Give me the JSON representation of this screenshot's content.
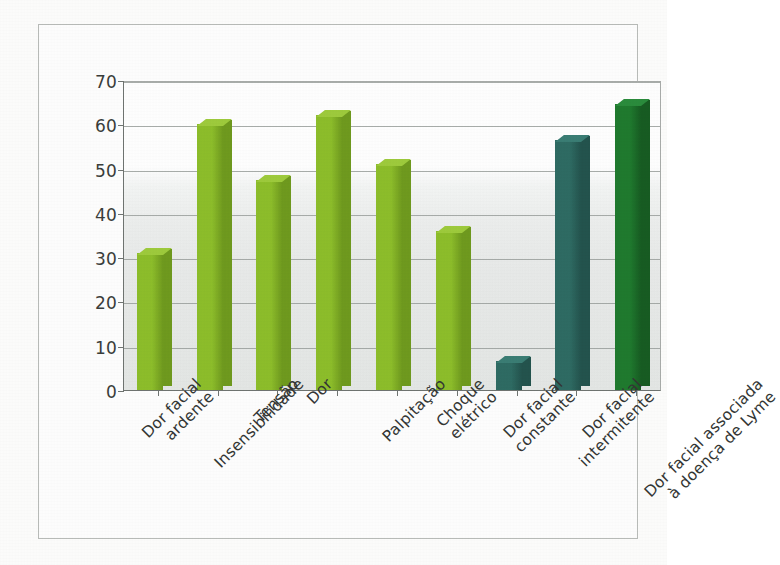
{
  "chart_data": {
    "type": "bar",
    "title": "",
    "xlabel": "",
    "ylabel": "",
    "ylim": [
      0,
      70
    ],
    "ytick_step": 10,
    "ytick_labels": [
      "0",
      "10",
      "20",
      "30",
      "40",
      "50",
      "60",
      "70"
    ],
    "grid": true,
    "legend": "none",
    "categories": [
      "Dor facial\nardente",
      "Insensibilidade",
      "Tensão",
      "Dor",
      "Palpitação",
      "Choque\nelétrico",
      "Dor facial\nconstante",
      "Dor facial\nintermitente",
      "Dor facial associada\nà doença de Lyme"
    ],
    "values": [
      31,
      60,
      47.5,
      62,
      51,
      36,
      6.5,
      56.5,
      64.5
    ],
    "bar_colors": [
      "#8dbe2a",
      "#8dbe2a",
      "#8dbe2a",
      "#8dbe2a",
      "#8dbe2a",
      "#8dbe2a",
      "#2e6b63",
      "#2e6b63",
      "#1f7a2e"
    ],
    "bar_side_colors": [
      "#6f9a1e",
      "#6f9a1e",
      "#6f9a1e",
      "#6f9a1e",
      "#6f9a1e",
      "#6f9a1e",
      "#23534d",
      "#23534d",
      "#175c22"
    ],
    "bar_top_colors": [
      "#9ecb3c",
      "#9ecb3c",
      "#9ecb3c",
      "#9ecb3c",
      "#9ecb3c",
      "#9ecb3c",
      "#3a7d74",
      "#3a7d74",
      "#2a8c3c"
    ]
  },
  "style": {
    "axis_color": "#6f7471",
    "grid_color": "#9aa09c",
    "frame_color": "#b9bcb9",
    "label_color": "#333634",
    "plot_background_top": "#ffffff",
    "plot_background_bottom": "#e4e7e5"
  }
}
